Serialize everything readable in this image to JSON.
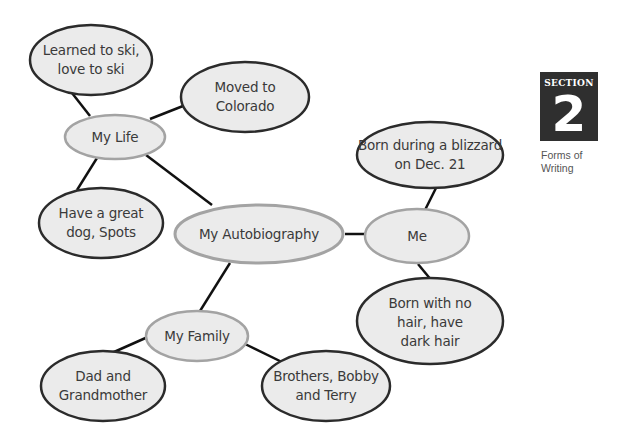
{
  "section": {
    "label": "SECTION",
    "number": "2",
    "caption_line1": "Forms of",
    "caption_line2": "Writing"
  },
  "web": {
    "center": "My Autobiography",
    "branches": [
      {
        "label": "My Life",
        "details": [
          "Learned to ski, love to ski",
          "Moved to Colorado",
          "Have a great dog, Spots"
        ]
      },
      {
        "label": "Me",
        "details": [
          "Born during a blizzard on Dec. 21",
          "Born with no hair, have dark hair"
        ]
      },
      {
        "label": "My Family",
        "details": [
          "Dad and Grandmother",
          "Brothers, Bobby and Terry"
        ]
      }
    ]
  },
  "nodes": {
    "center": "My Autobiography",
    "my_life": "My Life",
    "me": "Me",
    "my_family": "My Family",
    "ski_l1": "Learned to ski,",
    "ski_l2": "love to ski",
    "colorado_l1": "Moved to",
    "colorado_l2": "Colorado",
    "dog_l1": "Have a great",
    "dog_l2": "dog, Spots",
    "blizzard_l1": "Born during a blizzard",
    "blizzard_l2": "on Dec. 21",
    "hair_l1": "Born with no",
    "hair_l2": "hair, have",
    "hair_l3": "dark hair",
    "dad_l1": "Dad and",
    "dad_l2": "Grandmother",
    "brothers_l1": "Brothers, Bobby",
    "brothers_l2": "and Terry"
  },
  "colors": {
    "fill": "#ebebeb",
    "detail_stroke": "#2b2b2b",
    "main_stroke": "#a3a3a3",
    "connector": "#111111",
    "section_bg": "#2f2f2f"
  }
}
